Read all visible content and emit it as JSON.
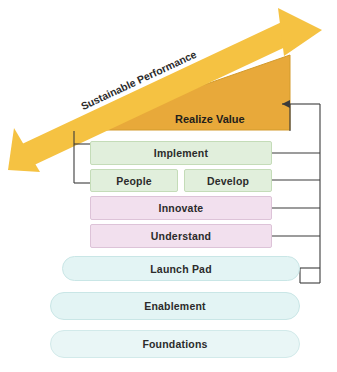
{
  "diagram": {
    "title_arrow": {
      "label": "Sustainable Performance",
      "color": "#f5c242"
    },
    "triangle": {
      "label": "Realize Value",
      "color": "#e8a93a"
    },
    "layers": [
      {
        "id": "implement",
        "label": "Implement",
        "shape": "rect",
        "fill": "#e1efdc",
        "border": "#c4dcb8"
      },
      {
        "id": "people",
        "label": "People",
        "shape": "rect",
        "fill": "#e1efdc",
        "border": "#c4dcb8"
      },
      {
        "id": "develop",
        "label": "Develop",
        "shape": "rect",
        "fill": "#e1efdc",
        "border": "#c4dcb8"
      },
      {
        "id": "innovate",
        "label": "Innovate",
        "shape": "rect",
        "fill": "#f2e0ee",
        "border": "#ddc3d8"
      },
      {
        "id": "understand",
        "label": "Understand",
        "shape": "rect",
        "fill": "#f2e0ee",
        "border": "#ddc3d8"
      },
      {
        "id": "launch-pad",
        "label": "Launch Pad",
        "shape": "round",
        "fill": "#e3f4f4",
        "border": "#c9e6e6"
      },
      {
        "id": "enablement",
        "label": "Enablement",
        "shape": "round",
        "fill": "#e3f4f4",
        "border": "#c9e6e6"
      },
      {
        "id": "foundations",
        "label": "Foundations",
        "shape": "round",
        "fill": "#e9f6f6",
        "border": "#d2eaea"
      }
    ],
    "connector_color": "#3b3b3b"
  }
}
